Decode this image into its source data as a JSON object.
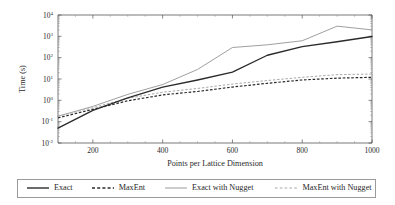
{
  "chart_data": {
    "type": "line",
    "title": "",
    "xlabel": "Points per Lattice Dimension",
    "ylabel": "Time (s)",
    "xscale": "linear",
    "yscale": "log",
    "xlim": [
      100,
      1000
    ],
    "ylim": [
      0.01,
      10000
    ],
    "xticks": [
      200,
      400,
      600,
      800,
      1000
    ],
    "xticklabels": [
      "200",
      "400",
      "600",
      "800",
      "1000"
    ],
    "yticks": [
      0.01,
      0.1,
      1,
      10,
      100,
      1000,
      10000
    ],
    "yticklabels": [
      "10⁻²",
      "10⁻¹",
      "10⁰",
      "10¹",
      "10²",
      "10³",
      "10⁴"
    ],
    "ytick_bases": [
      "10",
      "10",
      "10",
      "10",
      "10",
      "10",
      "10"
    ],
    "ytick_exponents": [
      "-2",
      "-1",
      "0",
      "1",
      "2",
      "3",
      "4"
    ],
    "grid": false,
    "legend_position": "below",
    "x": [
      100,
      200,
      300,
      400,
      500,
      600,
      700,
      800,
      900,
      1000
    ],
    "series": [
      {
        "name": "Exact",
        "style": "solid",
        "color": "#2b2b2b",
        "values": [
          0.05,
          0.34,
          1.3,
          4.2,
          9.0,
          21.0,
          130.0,
          330.0,
          560.0,
          980.0
        ]
      },
      {
        "name": "MaxEnt",
        "style": "dashed",
        "color": "#2b2b2b",
        "values": [
          0.15,
          0.38,
          0.95,
          1.8,
          2.6,
          4.2,
          6.3,
          9.0,
          11.0,
          12.0
        ]
      },
      {
        "name": "Exact with Nugget",
        "style": "solid",
        "color": "#9a9a9a",
        "values": [
          0.18,
          0.52,
          1.9,
          5.5,
          28.0,
          300.0,
          400.0,
          620.0,
          3000.0,
          2000.0
        ]
      },
      {
        "name": "MaxEnt with Nugget",
        "style": "dashed",
        "color": "#a8a8a8",
        "values": [
          0.18,
          0.45,
          1.25,
          2.4,
          3.6,
          5.8,
          8.5,
          12.0,
          16.0,
          17.0
        ]
      }
    ]
  },
  "legend": {
    "items": [
      {
        "label": "Exact",
        "style": "solid",
        "color": "#2b2b2b"
      },
      {
        "label": "MaxEnt",
        "style": "dashed",
        "color": "#2b2b2b"
      },
      {
        "label": "Exact with Nugget",
        "style": "solid",
        "color": "#9a9a9a"
      },
      {
        "label": "MaxEnt with Nugget",
        "style": "dashed",
        "color": "#a8a8a8"
      }
    ]
  }
}
